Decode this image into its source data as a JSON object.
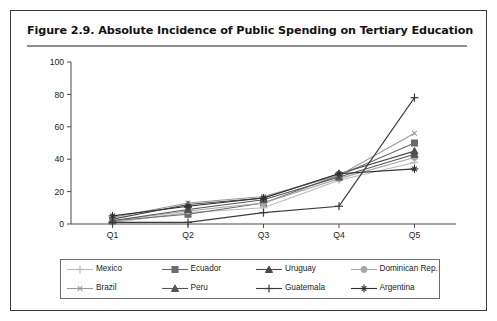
{
  "figure": {
    "title": "Figure 2.9.  Absolute Incidence of Public Spending on Tertiary Education"
  },
  "chart_data": {
    "type": "line",
    "title": "Figure 2.9.  Absolute Incidence of Public Spending on Tertiary Education",
    "xlabel": "",
    "ylabel": "",
    "categories": [
      "Q1",
      "Q2",
      "Q3",
      "Q4",
      "Q5"
    ],
    "x": [
      "Q1",
      "Q2",
      "Q3",
      "Q4",
      "Q5"
    ],
    "ylim": [
      0,
      100
    ],
    "yticks": [
      0,
      20,
      40,
      60,
      80,
      100
    ],
    "ytick_labels": [
      "0",
      "20",
      "40",
      "60",
      "80",
      "100"
    ],
    "grid": false,
    "legend_position": "bottom",
    "series": [
      {
        "name": "Mexico",
        "marker": "plus",
        "color": "#b9b9b9",
        "values": [
          1,
          7,
          10,
          27,
          38
        ]
      },
      {
        "name": "Ecuador",
        "marker": "square",
        "color": "#6b6b6b",
        "values": [
          2,
          6,
          13,
          30,
          50
        ]
      },
      {
        "name": "Uruguay",
        "marker": "triangle",
        "color": "#4a4a4a",
        "values": [
          3,
          12,
          16,
          31,
          45
        ]
      },
      {
        "name": "Dominican Rep.",
        "marker": "circle",
        "color": "#a8a8a8",
        "values": [
          2,
          8,
          13,
          28,
          41
        ]
      },
      {
        "name": "Brazil",
        "marker": "asterisk",
        "color": "#9a9a9a",
        "values": [
          4,
          13,
          17,
          30,
          56
        ]
      },
      {
        "name": "Peru",
        "marker": "triangle",
        "color": "#555555",
        "values": [
          2,
          9,
          15,
          29,
          43
        ]
      },
      {
        "name": "Guatemala",
        "marker": "plus",
        "color": "#3b3b3b",
        "values": [
          1,
          1,
          7,
          11,
          78
        ]
      },
      {
        "name": "Argentina",
        "marker": "star",
        "color": "#2e2e2e",
        "values": [
          5,
          11,
          16,
          31,
          34
        ]
      }
    ]
  },
  "legend": {
    "items": [
      {
        "label": "Mexico"
      },
      {
        "label": "Ecuador"
      },
      {
        "label": "Uruguay"
      },
      {
        "label": "Dominican Rep."
      },
      {
        "label": "Brazil"
      },
      {
        "label": "Peru"
      },
      {
        "label": "Guatemala"
      },
      {
        "label": "Argentina"
      }
    ]
  },
  "colors": {
    "frame": "#3a3a3a",
    "rule": "#8d8d8d",
    "axis": "#4a4a4a",
    "text": "#131313"
  }
}
